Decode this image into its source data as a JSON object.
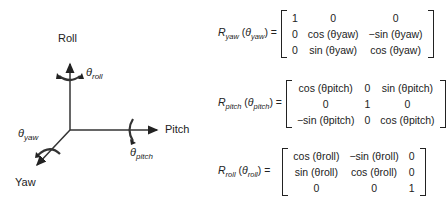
{
  "axes": {
    "roll_label": "Roll",
    "pitch_label": "Pitch",
    "yaw_label": "Yaw",
    "theta_roll": "θ",
    "theta_roll_sub": "roll",
    "theta_pitch": "θ",
    "theta_pitch_sub": "pitch",
    "theta_yaw": "θ",
    "theta_yaw_sub": "yaw"
  },
  "equations": {
    "yaw": {
      "lhs_R": "R",
      "lhs_sub": "yaw",
      "lhs_arg": "θ",
      "lhs_arg_sub": "yaw",
      "equals": "=",
      "rows": [
        [
          "1",
          "0",
          "0"
        ],
        [
          "0",
          "cos (θyaw)",
          "−sin (θyaw)"
        ],
        [
          "0",
          "sin (θyaw)",
          "cos (θyaw)"
        ]
      ]
    },
    "pitch": {
      "lhs_R": "R",
      "lhs_sub": "pitch",
      "lhs_arg": "θ",
      "lhs_arg_sub": "pitch",
      "equals": "=",
      "rows": [
        [
          "cos (θpitch)",
          "0",
          "sin (θpitch)"
        ],
        [
          "0",
          "1",
          "0"
        ],
        [
          "−sin (θpitch)",
          "0",
          "cos (θpitch)"
        ]
      ]
    },
    "roll": {
      "lhs_R": "R",
      "lhs_sub": "roll",
      "lhs_arg": "θ",
      "lhs_arg_sub": "roll",
      "equals": "=",
      "rows": [
        [
          "cos (θroll)",
          "−sin (θroll)",
          "0"
        ],
        [
          "sin (θroll)",
          "cos (θroll)",
          "0"
        ],
        [
          "0",
          "0",
          "1"
        ]
      ]
    }
  }
}
